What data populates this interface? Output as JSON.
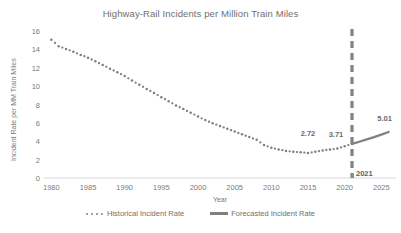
{
  "chart_data": {
    "type": "line",
    "title": "Highway-Rail Incidents per Million Train Miles",
    "xlabel": "Year",
    "ylabel": "Incident Rate per MM Train Miles",
    "xlim": [
      1979,
      2027
    ],
    "ylim": [
      0,
      16
    ],
    "xticks": [
      1980,
      1985,
      1990,
      1995,
      2000,
      2005,
      2010,
      2015,
      2020,
      2025
    ],
    "yticks": [
      0,
      2,
      4,
      6,
      8,
      10,
      12,
      14,
      16
    ],
    "grid": false,
    "legend_position": "bottom",
    "series": [
      {
        "name": "Historical Incident Rate",
        "style": "dotted",
        "color": "#7f7f7f",
        "x": [
          1980,
          1981,
          1982,
          1983,
          1984,
          1985,
          1986,
          1987,
          1988,
          1989,
          1990,
          1991,
          1992,
          1993,
          1994,
          1995,
          1996,
          1997,
          1998,
          1999,
          2000,
          2001,
          2002,
          2003,
          2004,
          2005,
          2006,
          2007,
          2008,
          2009,
          2010,
          2011,
          2012,
          2013,
          2014,
          2015,
          2016,
          2017,
          2018,
          2019,
          2020,
          2021
        ],
        "values": [
          15.05,
          14.35,
          14.05,
          13.75,
          13.4,
          13.1,
          12.7,
          12.3,
          11.9,
          11.5,
          11.1,
          10.6,
          10.15,
          9.7,
          9.25,
          8.8,
          8.35,
          7.9,
          7.5,
          7.1,
          6.7,
          6.3,
          5.95,
          5.65,
          5.35,
          5.05,
          4.75,
          4.45,
          4.15,
          3.6,
          3.3,
          3.1,
          2.95,
          2.85,
          2.8,
          2.72,
          2.85,
          3.0,
          3.1,
          3.2,
          3.45,
          3.71
        ]
      },
      {
        "name": "Forecasted Incident Rate",
        "style": "solid",
        "color": "#808080",
        "x": [
          2021,
          2022,
          2023,
          2024,
          2025,
          2026
        ],
        "values": [
          3.71,
          3.95,
          4.2,
          4.45,
          4.72,
          5.01
        ]
      }
    ],
    "annotations": [
      {
        "label": "2.72",
        "x": 2015,
        "y": 2.72,
        "dx": 0,
        "dy": -16
      },
      {
        "label": "3.71",
        "x": 2021,
        "y": 3.71,
        "dx": -16,
        "dy": -6
      },
      {
        "label": "5.01",
        "x": 2026,
        "y": 5.01,
        "dx": -4,
        "dy": -10
      }
    ],
    "vertical_marker": {
      "label": "2021",
      "x": 2021,
      "style": "dashed",
      "color": "#808080"
    }
  },
  "legend": {
    "items": [
      {
        "label": "Historical Incident Rate",
        "marker": "dotted-marker"
      },
      {
        "label": "Forecasted Incident Rate",
        "marker": "solid-line-marker"
      }
    ]
  },
  "colors": {
    "series": "#7f7f7f",
    "forecast": "#808080",
    "axis": "#d9d9d9",
    "text": "#7a7a7a",
    "title": "#6f6f6f"
  }
}
